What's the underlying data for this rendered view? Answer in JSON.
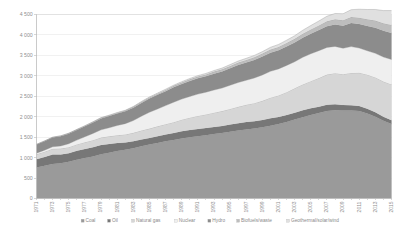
{
  "chart_data": {
    "type": "area",
    "title": "",
    "xlabel": "",
    "ylabel": "",
    "stacked": true,
    "grid": true,
    "legend_position": "bottom",
    "ylim": [
      0,
      4500
    ],
    "yticks": [
      0,
      500,
      1000,
      1500,
      2000,
      2500,
      3000,
      3500,
      4000,
      4500
    ],
    "ytick_labels": [
      "0",
      "500",
      "1 000",
      "1 500",
      "2 000",
      "2 500",
      "3 000",
      "3 500",
      "4 000",
      "4 500"
    ],
    "xlim": [
      1971,
      2015
    ],
    "x": [
      1971,
      1972,
      1973,
      1974,
      1975,
      1976,
      1977,
      1978,
      1979,
      1980,
      1981,
      1982,
      1983,
      1984,
      1985,
      1986,
      1987,
      1988,
      1989,
      1990,
      1991,
      1992,
      1993,
      1994,
      1995,
      1996,
      1997,
      1998,
      1999,
      2000,
      2001,
      2002,
      2003,
      2004,
      2005,
      2006,
      2007,
      2008,
      2009,
      2010,
      2011,
      2012,
      2013,
      2014,
      2015
    ],
    "xtick_labels": [
      "1971",
      "1973",
      "1975",
      "1977",
      "1979",
      "1981",
      "1983",
      "1985",
      "1987",
      "1989",
      "1991",
      "1993",
      "1995",
      "1997",
      "1999",
      "2001",
      "2003",
      "2005",
      "2007",
      "2009",
      "2011",
      "2013",
      "2015"
    ],
    "series": [
      {
        "name": "Coal",
        "color": "#9a9a9a",
        "values": [
          760,
          800,
          845,
          860,
          900,
          950,
          990,
          1030,
          1080,
          1120,
          1160,
          1190,
          1230,
          1280,
          1320,
          1360,
          1400,
          1430,
          1470,
          1500,
          1520,
          1545,
          1575,
          1600,
          1630,
          1660,
          1690,
          1710,
          1740,
          1780,
          1820,
          1870,
          1930,
          1990,
          2040,
          2090,
          2140,
          2160,
          2150,
          2150,
          2140,
          2080,
          2000,
          1900,
          1820
        ]
      },
      {
        "name": "Oil",
        "color": "#777777",
        "values": [
          200,
          215,
          230,
          215,
          205,
          215,
          220,
          225,
          230,
          215,
          195,
          180,
          170,
          165,
          160,
          165,
          165,
          170,
          175,
          175,
          180,
          178,
          175,
          175,
          178,
          180,
          182,
          180,
          178,
          180,
          175,
          170,
          170,
          168,
          165,
          155,
          150,
          145,
          135,
          130,
          125,
          118,
          110,
          100,
          95
        ]
      },
      {
        "name": "Natural gas",
        "color": "#d6d6d6",
        "values": [
          120,
          130,
          140,
          145,
          150,
          158,
          165,
          172,
          180,
          185,
          190,
          196,
          205,
          218,
          230,
          240,
          252,
          265,
          282,
          300,
          318,
          332,
          348,
          362,
          382,
          402,
          420,
          442,
          470,
          505,
          525,
          560,
          595,
          630,
          665,
          700,
          740,
          760,
          755,
          790,
          810,
          830,
          850,
          860,
          875
        ]
      },
      {
        "name": "Nuclear",
        "color": "#efefef",
        "values": [
          28,
          38,
          50,
          65,
          85,
          105,
          135,
          165,
          190,
          210,
          240,
          265,
          300,
          350,
          400,
          425,
          455,
          490,
          505,
          520,
          535,
          545,
          555,
          565,
          580,
          595,
          600,
          615,
          635,
          645,
          650,
          655,
          650,
          665,
          670,
          670,
          665,
          655,
          635,
          645,
          605,
          585,
          590,
          600,
          610
        ]
      },
      {
        "name": "Hydro",
        "color": "#8c8c8c",
        "values": [
          210,
          218,
          225,
          238,
          245,
          248,
          255,
          268,
          278,
          285,
          292,
          300,
          315,
          325,
          335,
          345,
          352,
          365,
          368,
          378,
          385,
          388,
          400,
          405,
          415,
          428,
          432,
          440,
          448,
          455,
          455,
          462,
          468,
          478,
          490,
          505,
          518,
          535,
          548,
          575,
          585,
          605,
          625,
          640,
          650
        ]
      },
      {
        "name": "Biofuels/waste",
        "color": "#bdbdbd",
        "values": [
          5,
          6,
          7,
          8,
          9,
          10,
          11,
          12,
          14,
          15,
          17,
          19,
          21,
          23,
          26,
          29,
          32,
          35,
          38,
          41,
          44,
          47,
          50,
          53,
          57,
          61,
          65,
          69,
          73,
          78,
          82,
          87,
          92,
          98,
          104,
          112,
          120,
          128,
          136,
          146,
          156,
          166,
          176,
          186,
          196
        ]
      },
      {
        "name": "Geothermal/solar/wind",
        "color": "#e0e0e0",
        "values": [
          2,
          2,
          3,
          3,
          4,
          4,
          5,
          5,
          6,
          7,
          8,
          9,
          10,
          11,
          13,
          14,
          16,
          17,
          19,
          21,
          23,
          25,
          27,
          30,
          33,
          36,
          40,
          44,
          49,
          55,
          61,
          68,
          76,
          86,
          97,
          110,
          125,
          142,
          160,
          182,
          208,
          238,
          272,
          310,
          350
        ]
      }
    ]
  },
  "legend": {
    "items": [
      {
        "label": "Coal",
        "marker_color": "#9a9a9a"
      },
      {
        "label": "Oil",
        "marker_color": "#777777"
      },
      {
        "label": "Natural gas",
        "marker_color": "#d6d6d6"
      },
      {
        "label": "Nuclear",
        "marker_color": "#efefef"
      },
      {
        "label": "Hydro",
        "marker_color": "#8c8c8c"
      },
      {
        "label": "Biofuels/waste",
        "marker_color": "#bdbdbd"
      },
      {
        "label": "Geothermal/solar/wind",
        "marker_color": "#e0e0e0"
      }
    ]
  }
}
